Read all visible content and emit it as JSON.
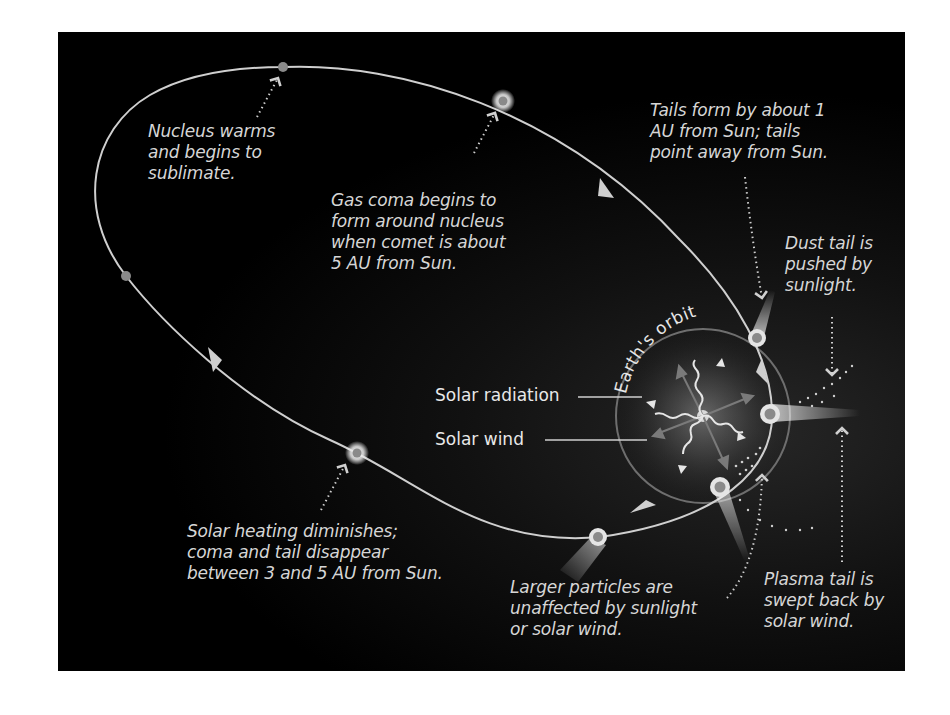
{
  "diagram": {
    "kind": "comet-orbit-illustration",
    "colors": {
      "background": "#000000",
      "orbit_line": "#cfcfcf",
      "earth_orbit": "#6e6e6e",
      "text": "#d6d6d6",
      "comet_glow": "#ffffff",
      "nucleus": "#8a8a8a"
    },
    "labels": {
      "earth_orbit": "Earth's orbit",
      "solar_radiation": "Solar radiation",
      "solar_wind": "Solar wind"
    },
    "captions": {
      "nucleus_warms": "Nucleus warms\nand begins to\nsublimate.",
      "gas_coma": "Gas coma begins to\nform around nucleus\nwhen comet is about\n5 AU from Sun.",
      "tails_form": "Tails form by about 1\nAU from Sun; tails\npoint away from Sun.",
      "dust_tail": "Dust tail is\npushed by\nsunlight.",
      "solar_heating": "Solar heating diminishes;\ncoma and tail disappear\nbetween 3 and 5 AU from Sun.",
      "larger_particles": "Larger particles are\nunaffected by sunlight\nor solar wind.",
      "plasma_tail": "Plasma tail is\nswept back by\nsolar wind."
    },
    "stages": [
      {
        "name": "nucleus-warming",
        "x": 283,
        "y": 67
      },
      {
        "name": "gas-coma-forming",
        "x": 503,
        "y": 101
      },
      {
        "name": "tails-forming",
        "x": 757,
        "y": 338
      },
      {
        "name": "perihelion",
        "x": 770,
        "y": 414
      },
      {
        "name": "outbound-near-sun",
        "x": 720,
        "y": 487
      },
      {
        "name": "outbound",
        "x": 598,
        "y": 537
      },
      {
        "name": "tail-fading",
        "x": 357,
        "y": 453
      },
      {
        "name": "inactive-left",
        "x": 126,
        "y": 276
      }
    ],
    "sun": {
      "x": 703,
      "y": 416
    }
  }
}
